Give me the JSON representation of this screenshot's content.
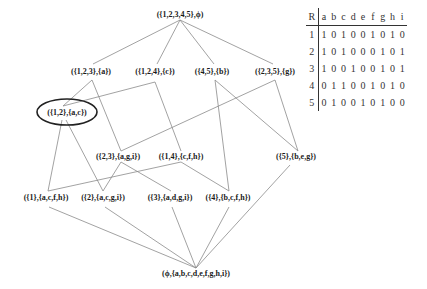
{
  "diagram": {
    "type": "concept-lattice",
    "nodes": [
      {
        "id": "top",
        "label": "({1,2,3,4,5},ϕ)",
        "x": 180,
        "y": 14
      },
      {
        "id": "n123",
        "label": "({1,2,3},{a})",
        "x": 91,
        "y": 71
      },
      {
        "id": "n124",
        "label": "({1,2,4},{c})",
        "x": 155,
        "y": 71
      },
      {
        "id": "n45",
        "label": "({4,5},{b})",
        "x": 212,
        "y": 71
      },
      {
        "id": "n235",
        "label": "({2,3,5},{g})",
        "x": 275,
        "y": 71
      },
      {
        "id": "n12",
        "label": "({1,2},{a,c})",
        "x": 67,
        "y": 112,
        "highlighted": true
      },
      {
        "id": "n23",
        "label": "({2,3},{a,g,i})",
        "x": 118,
        "y": 156
      },
      {
        "id": "n14",
        "label": "({1,4},{c,f,h})",
        "x": 181,
        "y": 156
      },
      {
        "id": "n5",
        "label": "({5},{b,e,g})",
        "x": 296,
        "y": 156
      },
      {
        "id": "n1",
        "label": "({1},{a,c,f,h})",
        "x": 46,
        "y": 197
      },
      {
        "id": "n2",
        "label": "({2},{a,c,g,i})",
        "x": 103,
        "y": 197
      },
      {
        "id": "n3",
        "label": "({3},{a,d,g,i})",
        "x": 170,
        "y": 197
      },
      {
        "id": "n4",
        "label": "({4},{b,c,f,h})",
        "x": 228,
        "y": 197
      },
      {
        "id": "bottom",
        "label": "(ϕ,{a,b,c,d,e,f,g,h,i})",
        "x": 196,
        "y": 273
      }
    ],
    "edges": [
      {
        "from": [
          180,
          20
        ],
        "to": [
          93,
          64
        ]
      },
      {
        "from": [
          180,
          20
        ],
        "to": [
          157,
          64
        ]
      },
      {
        "from": [
          180,
          20
        ],
        "to": [
          214,
          64
        ]
      },
      {
        "from": [
          180,
          20
        ],
        "to": [
          273,
          64
        ]
      },
      {
        "from": [
          92,
          80
        ],
        "to": [
          63,
          106
        ]
      },
      {
        "from": [
          92,
          80
        ],
        "to": [
          121,
          151
        ]
      },
      {
        "from": [
          155,
          82
        ],
        "to": [
          63,
          106
        ]
      },
      {
        "from": [
          155,
          82
        ],
        "to": [
          181,
          151
        ]
      },
      {
        "from": [
          215,
          80
        ],
        "to": [
          229,
          191
        ]
      },
      {
        "from": [
          215,
          80
        ],
        "to": [
          298,
          151
        ]
      },
      {
        "from": [
          275,
          80
        ],
        "to": [
          121,
          151
        ]
      },
      {
        "from": [
          275,
          80
        ],
        "to": [
          298,
          151
        ]
      },
      {
        "from": [
          62,
          120
        ],
        "to": [
          48,
          191
        ]
      },
      {
        "from": [
          66,
          120
        ],
        "to": [
          103,
          191
        ]
      },
      {
        "from": [
          121,
          162
        ],
        "to": [
          103,
          191
        ]
      },
      {
        "from": [
          121,
          162
        ],
        "to": [
          171,
          191
        ]
      },
      {
        "from": [
          181,
          162
        ],
        "to": [
          48,
          191
        ]
      },
      {
        "from": [
          181,
          162
        ],
        "to": [
          229,
          191
        ]
      },
      {
        "from": [
          49,
          207
        ],
        "to": [
          196,
          268
        ]
      },
      {
        "from": [
          105,
          207
        ],
        "to": [
          196,
          268
        ]
      },
      {
        "from": [
          172,
          207
        ],
        "to": [
          196,
          268
        ]
      },
      {
        "from": [
          229,
          207
        ],
        "to": [
          196,
          268
        ]
      },
      {
        "from": [
          290,
          165
        ],
        "to": [
          196,
          268
        ]
      }
    ],
    "highlight_ellipse": {
      "cx": 67,
      "cy": 112,
      "rx": 30,
      "ry": 13
    }
  },
  "context_table": {
    "corner": "R",
    "columns": [
      "a",
      "b",
      "c",
      "d",
      "e",
      "f",
      "g",
      "h",
      "i"
    ],
    "rows": [
      {
        "label": "1",
        "values": [
          "1",
          "0",
          "1",
          "0",
          "0",
          "1",
          "0",
          "1",
          "0"
        ]
      },
      {
        "label": "2",
        "values": [
          "1",
          "0",
          "1",
          "0",
          "0",
          "0",
          "1",
          "0",
          "1"
        ]
      },
      {
        "label": "3",
        "values": [
          "1",
          "0",
          "0",
          "1",
          "0",
          "0",
          "1",
          "0",
          "1"
        ]
      },
      {
        "label": "4",
        "values": [
          "0",
          "1",
          "1",
          "0",
          "0",
          "1",
          "0",
          "1",
          "0"
        ]
      },
      {
        "label": "5",
        "values": [
          "0",
          "1",
          "0",
          "0",
          "1",
          "0",
          "1",
          "0",
          "0"
        ]
      }
    ]
  },
  "colors": {
    "edge": "#8a8a8a",
    "ellipse": "#222222",
    "text": "#1a1a1a"
  }
}
